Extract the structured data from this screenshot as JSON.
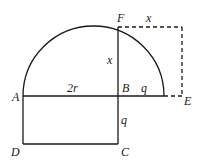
{
  "diagram": {
    "type": "geometry",
    "points": {
      "A": {
        "label": "A",
        "x": 23,
        "y": 96
      },
      "B": {
        "label": "B",
        "x": 118,
        "y": 96
      },
      "C": {
        "label": "C",
        "x": 118,
        "y": 144
      },
      "D": {
        "label": "D",
        "x": 23,
        "y": 144
      },
      "E": {
        "label": "E",
        "x": 182,
        "y": 96
      },
      "F": {
        "label": "F",
        "x": 118,
        "y": 27
      }
    },
    "segment_labels": {
      "AB": "2r",
      "FB": "x",
      "F_top": "x",
      "B_right": "q",
      "BC": "q"
    },
    "colors": {
      "stroke": "#1a1a1a",
      "background": "#ffffff"
    }
  }
}
